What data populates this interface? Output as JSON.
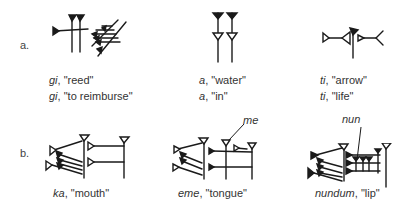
{
  "rows": [
    {
      "label": "a.",
      "items": [
        {
          "sign": "gi",
          "glosses": [
            {
              "reading": "gi",
              "meaning": "\"reed\""
            },
            {
              "reading": "gi",
              "meaning": "\"to reimburse\""
            }
          ]
        },
        {
          "sign": "a",
          "glosses": [
            {
              "reading": "a",
              "meaning": "\"water\""
            },
            {
              "reading": "a",
              "meaning": "\"in\""
            }
          ]
        },
        {
          "sign": "ti",
          "glosses": [
            {
              "reading": "ti",
              "meaning": "\"arrow\""
            },
            {
              "reading": "ti",
              "meaning": "\"life\""
            }
          ]
        }
      ]
    },
    {
      "label": "b.",
      "items": [
        {
          "sign": "ka",
          "glosses": [
            {
              "reading": "ka",
              "meaning": "\"mouth\""
            }
          ]
        },
        {
          "sign": "eme",
          "annotation": "me",
          "glosses": [
            {
              "reading": "eme",
              "meaning": "\"tongue\""
            }
          ]
        },
        {
          "sign": "nundum",
          "annotation": "nun",
          "glosses": [
            {
              "reading": "nundum",
              "meaning": "\"lip\""
            }
          ]
        }
      ]
    }
  ],
  "separator": ", "
}
